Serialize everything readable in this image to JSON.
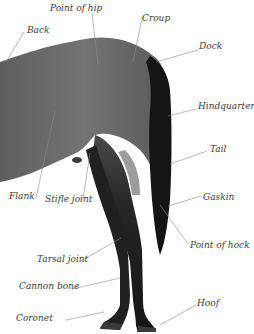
{
  "diagram": {
    "colors": {
      "body": "#6e6e6e",
      "body_shadow": "#4f4f4f",
      "tail": "#141414",
      "legs": "#1c1c1c",
      "leader_line": "#8a8a8a",
      "label_text": "#3a3a3a",
      "background": "#ffffff"
    },
    "labels": [
      {
        "id": "back",
        "text": "Back"
      },
      {
        "id": "point-of-hip",
        "text": "Point of hip"
      },
      {
        "id": "croup",
        "text": "Croup"
      },
      {
        "id": "dock",
        "text": "Dock"
      },
      {
        "id": "hindquarters",
        "text": "Hindquarters"
      },
      {
        "id": "tail",
        "text": "Tail"
      },
      {
        "id": "flank",
        "text": "Flank"
      },
      {
        "id": "stifle-joint",
        "text": "Stifle joint"
      },
      {
        "id": "gaskin",
        "text": "Gaskin"
      },
      {
        "id": "point-of-hock",
        "text": "Point of hock"
      },
      {
        "id": "tarsal-joint",
        "text": "Tarsal joint"
      },
      {
        "id": "cannon-bone",
        "text": "Cannon bone"
      },
      {
        "id": "hoof",
        "text": "Hoof"
      },
      {
        "id": "coronet",
        "text": "Coronet"
      }
    ]
  }
}
